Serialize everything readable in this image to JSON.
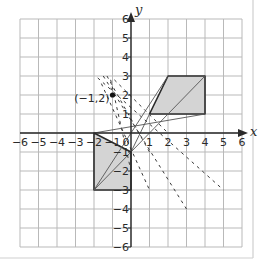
{
  "diagram": {
    "type": "coordinate-grid-transformation",
    "axes": {
      "x_label": "x",
      "y_label": "y",
      "x_range": [
        -6,
        6
      ],
      "y_range": [
        -6,
        6
      ],
      "x_ticks": [
        "-6",
        "-5",
        "-4",
        "-3",
        "-2",
        "-1",
        "0",
        "1",
        "2",
        "3",
        "4",
        "5",
        "6"
      ],
      "y_ticks": [
        "6",
        "5",
        "4",
        "3",
        "2",
        "1",
        "-1",
        "-2",
        "-3",
        "-4",
        "-5",
        "-6"
      ],
      "origin_label": "0"
    },
    "center_point": {
      "label": "(−1,2)",
      "x": -1,
      "y": 2
    },
    "shapes": [
      {
        "name": "object-parallelogram",
        "vertices": [
          [
            1,
            1
          ],
          [
            2,
            3
          ],
          [
            4,
            3
          ],
          [
            4,
            1
          ]
        ],
        "fill": "#d4d4d4"
      },
      {
        "name": "image-quadrilateral",
        "vertices": [
          [
            -2,
            0
          ],
          [
            0,
            -1
          ],
          [
            0,
            -3
          ],
          [
            -2,
            -3
          ]
        ],
        "fill": "#d4d4d4"
      }
    ],
    "solid_lines": [
      [
        [
          4,
          3
        ],
        [
          -2,
          -3
        ]
      ],
      [
        [
          4,
          1
        ],
        [
          -2,
          0
        ]
      ],
      [
        [
          2,
          3
        ],
        [
          -2,
          -3
        ]
      ],
      [
        [
          1,
          1
        ],
        [
          0,
          -1
        ]
      ]
    ],
    "dashed_lines": [
      [
        [
          -1.5,
          3
        ],
        [
          3,
          -4
        ]
      ],
      [
        [
          -1.8,
          2.9
        ],
        [
          5,
          -3
        ]
      ],
      [
        [
          -1.3,
          3
        ],
        [
          1,
          -1
        ]
      ],
      [
        [
          -1.1,
          2.8
        ],
        [
          0,
          -2
        ]
      ],
      [
        [
          -0.9,
          2.8
        ],
        [
          2,
          0
        ]
      ],
      [
        [
          -1.6,
          2.6
        ],
        [
          1,
          -3
        ]
      ]
    ],
    "colors": {
      "grid": "#b9b9b9",
      "axis": "#2a2a2a",
      "shape_fill": "#d4d4d4",
      "shape_stroke": "#2a2a2a",
      "frame": "#cfcfcf"
    }
  }
}
